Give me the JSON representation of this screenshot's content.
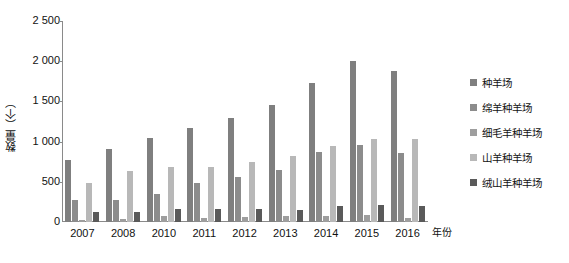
{
  "chart_data": {
    "type": "bar",
    "title": "",
    "subtitle": "",
    "xlabel": "年份",
    "ylabel": "数量（个）",
    "ylim": [
      0,
      2500
    ],
    "ytick_labels": [
      "2 500",
      "2 000",
      "1 500",
      "1 000",
      "500",
      "0"
    ],
    "ytick_values": [
      2500,
      2000,
      1500,
      1000,
      500,
      0
    ],
    "grid": false,
    "legend_position": "right",
    "categories": [
      "2007",
      "2008",
      "2010",
      "2011",
      "2012",
      "2013",
      "2014",
      "2015",
      "2016"
    ],
    "series": [
      {
        "name": "种羊场",
        "color": "#7f7f7f",
        "values": [
          770,
          910,
          1040,
          1170,
          1290,
          1460,
          1730,
          2000,
          1880
        ]
      },
      {
        "name": "绵羊种羊场",
        "color": "#8c8c8c",
        "values": [
          270,
          280,
          350,
          480,
          555,
          650,
          870,
          960,
          860
        ]
      },
      {
        "name": "细毛羊种羊场",
        "color": "#9e9e9e",
        "values": [
          30,
          35,
          70,
          55,
          60,
          70,
          75,
          90,
          55
        ]
      },
      {
        "name": "山羊种羊场",
        "color": "#b8b8b8",
        "values": [
          490,
          630,
          690,
          690,
          745,
          820,
          940,
          1030,
          1030
        ]
      },
      {
        "name": "绒山羊种羊场",
        "color": "#5a5a5a",
        "values": [
          120,
          130,
          160,
          165,
          165,
          150,
          195,
          215,
          195
        ]
      }
    ]
  },
  "axes": {
    "y_title": "数量（个）",
    "x_title": "年份"
  },
  "legend": {
    "items": [
      {
        "label": "种羊场",
        "color": "#7f7f7f"
      },
      {
        "label": "绵羊种羊场",
        "color": "#8c8c8c"
      },
      {
        "label": "细毛羊种羊场",
        "color": "#9e9e9e"
      },
      {
        "label": "山羊种羊场",
        "color": "#b8b8b8"
      },
      {
        "label": "绒山羊种羊场",
        "color": "#5a5a5a"
      }
    ]
  },
  "caption": {
    "text": ""
  }
}
